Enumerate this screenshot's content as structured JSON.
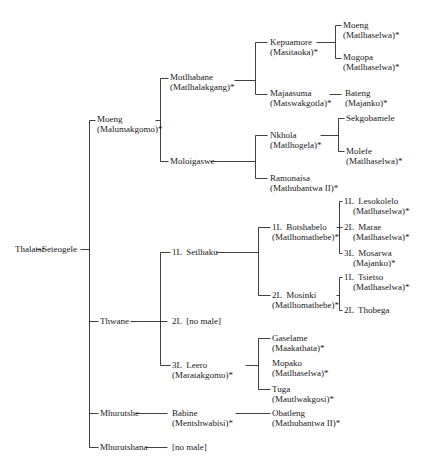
{
  "diagram": {
    "type": "genealogy-tree",
    "line_color": "#2a2a2a",
    "text_color": "#1a1a1a",
    "nodes": [
      {
        "id": "thalatsi",
        "name": "Thalatsi",
        "sub": "",
        "x": 15,
        "y": 244
      },
      {
        "id": "seteogele",
        "name": "Seteogele",
        "sub": "",
        "x": 42,
        "y": 244
      },
      {
        "id": "moeng1",
        "name": "Moeng",
        "sub": "(Malumakgomo)*",
        "x": 97,
        "y": 114
      },
      {
        "id": "thwane",
        "name": "Thwane",
        "sub": "",
        "x": 100,
        "y": 316
      },
      {
        "id": "mhurutshe",
        "name": "Mhurutshe",
        "sub": "",
        "x": 100,
        "y": 408
      },
      {
        "id": "mhurutshana",
        "name": "Mhurutshana",
        "sub": "",
        "x": 100,
        "y": 442
      },
      {
        "id": "motlhabane",
        "name": "Motlhabane",
        "sub": "(Matlhalakgang)*",
        "x": 170,
        "y": 72
      },
      {
        "id": "moloigaswe",
        "name": "Moloigaswe",
        "sub": "",
        "x": 170,
        "y": 156
      },
      {
        "id": "setlhaku",
        "name": "1L  Setlhaku",
        "sub": "",
        "x": 172,
        "y": 247
      },
      {
        "id": "twol-nomale",
        "name": "2L  [no male]",
        "sub": "",
        "x": 172,
        "y": 316
      },
      {
        "id": "leero",
        "name": "3L  Leero",
        "sub": "(Maratakgomo)*",
        "x": 172,
        "y": 360
      },
      {
        "id": "babine",
        "name": "Babine",
        "sub": "(Mentshwabisi)*",
        "x": 172,
        "y": 408
      },
      {
        "id": "nomale2",
        "name": "[no male]",
        "sub": "",
        "x": 172,
        "y": 442
      },
      {
        "id": "kepuamore",
        "name": "Kepuamore",
        "sub": "(Masitaoka)*",
        "x": 270,
        "y": 37
      },
      {
        "id": "majaasuma",
        "name": "Majaasuma",
        "sub": "(Matswakgotla)*",
        "x": 270,
        "y": 88
      },
      {
        "id": "nkhola",
        "name": "Nkhola",
        "sub": "(Matlhogela)*",
        "x": 270,
        "y": 130
      },
      {
        "id": "ramonaisa",
        "name": "Ramonaisa",
        "sub": "(Mathubantwa II)*",
        "x": 270,
        "y": 173
      },
      {
        "id": "botshabelo",
        "name": "1L  Botshabelo",
        "sub": "(Matlhomathebe)*",
        "x": 272,
        "y": 222
      },
      {
        "id": "mosinki",
        "name": "2L  Mosinki",
        "sub": "(Matlhomathebe)*",
        "x": 272,
        "y": 290
      },
      {
        "id": "gaselame",
        "name": "Gaselame",
        "sub": "(Maakathata)*",
        "x": 272,
        "y": 333
      },
      {
        "id": "mopako",
        "name": "Mopako",
        "sub": "(Matlhaselwa)*",
        "x": 272,
        "y": 358
      },
      {
        "id": "tuga",
        "name": "Tuga",
        "sub": "(Mautlwakgosi)*",
        "x": 272,
        "y": 384
      },
      {
        "id": "obatleng",
        "name": "Obatleng",
        "sub": "(Mathubantwa II)*",
        "x": 272,
        "y": 408
      },
      {
        "id": "moeng2",
        "name": "Moeng",
        "sub": "(Matlhaselwa)*",
        "x": 343,
        "y": 20
      },
      {
        "id": "mogopa",
        "name": "Mogopa",
        "sub": "(Matlhaselwa)*",
        "x": 343,
        "y": 52
      },
      {
        "id": "bateng",
        "name": "Bateng",
        "sub": "(Majanko)*",
        "x": 345,
        "y": 88
      },
      {
        "id": "sekgobamele",
        "name": "Sekgobamele",
        "sub": "",
        "x": 346,
        "y": 113
      },
      {
        "id": "molefe",
        "name": "Molefe",
        "sub": "(Matlhaselwa)*",
        "x": 346,
        "y": 146
      },
      {
        "id": "lesokolelo",
        "name": "1L  Lesokolelo",
        "sub": "    (Matlhaselwa)*",
        "x": 344,
        "y": 196
      },
      {
        "id": "marae",
        "name": "2L  Marae",
        "sub": "    (Matlhaselwa)*",
        "x": 344,
        "y": 222
      },
      {
        "id": "mosarwa",
        "name": "3L  Mosarwa",
        "sub": "    (Majanko)*",
        "x": 344,
        "y": 248
      },
      {
        "id": "tsietso",
        "name": "1L  Tsietso",
        "sub": "    (Matlhaselwa)*",
        "x": 344,
        "y": 272
      },
      {
        "id": "thobega",
        "name": "2L  Thobega",
        "sub": "",
        "x": 344,
        "y": 305
      }
    ],
    "lines": [
      [
        36,
        249,
        41,
        249
      ],
      [
        80,
        249,
        89,
        249
      ],
      [
        89,
        120,
        89,
        447
      ],
      [
        89,
        120,
        95,
        120
      ],
      [
        89,
        321,
        98,
        321
      ],
      [
        89,
        413,
        98,
        413
      ],
      [
        89,
        447,
        98,
        447
      ],
      [
        155,
        120,
        160,
        120
      ],
      [
        160,
        78,
        160,
        161
      ],
      [
        160,
        78,
        168,
        78
      ],
      [
        160,
        161,
        168,
        161
      ],
      [
        130,
        321,
        167,
        321
      ],
      [
        160,
        252,
        160,
        365
      ],
      [
        160,
        252,
        170,
        252
      ],
      [
        160,
        365,
        170,
        365
      ],
      [
        135,
        413,
        167,
        413
      ],
      [
        145,
        447,
        167,
        447
      ],
      [
        234,
        80,
        255,
        80
      ],
      [
        255,
        42,
        255,
        94
      ],
      [
        255,
        42,
        267,
        42
      ],
      [
        255,
        94,
        267,
        94
      ],
      [
        210,
        161,
        255,
        161
      ],
      [
        255,
        135,
        255,
        178
      ],
      [
        255,
        135,
        267,
        135
      ],
      [
        255,
        178,
        267,
        178
      ],
      [
        216,
        252,
        258,
        252
      ],
      [
        258,
        227,
        258,
        295
      ],
      [
        258,
        227,
        270,
        227
      ],
      [
        258,
        295,
        270,
        295
      ],
      [
        245,
        365,
        258,
        365
      ],
      [
        258,
        338,
        258,
        389
      ],
      [
        258,
        338,
        270,
        338
      ],
      [
        258,
        389,
        270,
        389
      ],
      [
        235,
        413,
        270,
        413
      ],
      [
        316,
        42,
        335,
        42
      ],
      [
        335,
        25,
        335,
        58
      ],
      [
        335,
        25,
        341,
        25
      ],
      [
        335,
        58,
        341,
        58
      ],
      [
        329,
        94,
        341,
        94
      ],
      [
        320,
        135,
        338,
        135
      ],
      [
        338,
        118,
        338,
        151
      ],
      [
        338,
        118,
        344,
        118
      ],
      [
        338,
        151,
        344,
        151
      ],
      [
        336,
        227,
        339,
        227
      ],
      [
        339,
        201,
        339,
        253
      ],
      [
        339,
        201,
        342,
        201
      ],
      [
        339,
        227,
        342,
        227
      ],
      [
        339,
        253,
        342,
        253
      ],
      [
        336,
        295,
        339,
        295
      ],
      [
        339,
        277,
        339,
        310
      ],
      [
        339,
        277,
        342,
        277
      ],
      [
        339,
        310,
        342,
        310
      ]
    ]
  }
}
